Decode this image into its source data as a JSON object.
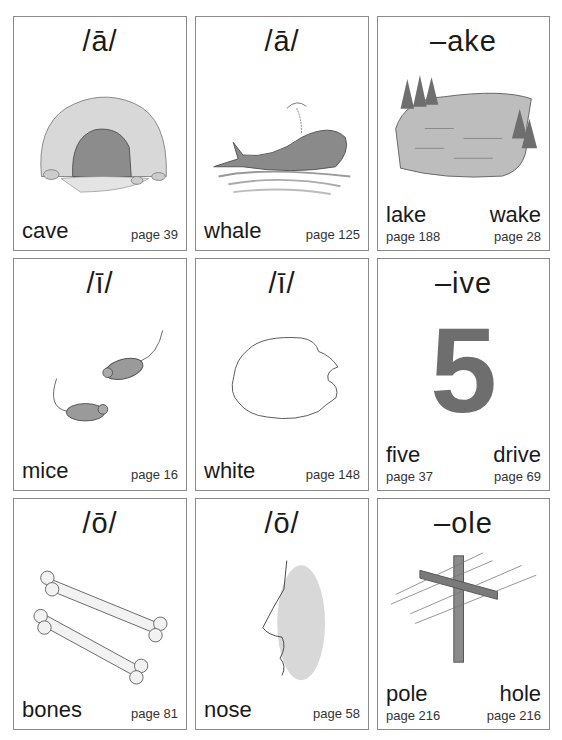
{
  "cards": [
    {
      "title": "/ā/",
      "word": "cave",
      "page": "page 39",
      "picture": "cave-illustration"
    },
    {
      "title": "/ā/",
      "word": "whale",
      "page": "page 125",
      "picture": "whale-illustration"
    },
    {
      "title": "–ake",
      "words": [
        {
          "word": "lake",
          "page": "page 188"
        },
        {
          "word": "wake",
          "page": "page 28"
        }
      ],
      "picture": "lake-illustration"
    },
    {
      "title": "/ī/",
      "word": "mice",
      "page": "page 16",
      "picture": "mice-illustration"
    },
    {
      "title": "/ī/",
      "word": "white",
      "page": "page 148",
      "picture": "white-blob-outline"
    },
    {
      "title": "–ive",
      "words": [
        {
          "word": "five",
          "page": "page 37"
        },
        {
          "word": "drive",
          "page": "page 69"
        }
      ],
      "picture": "number-five",
      "numeral": "5"
    },
    {
      "title": "/ō/",
      "word": "bones",
      "page": "page 81",
      "picture": "bones-illustration"
    },
    {
      "title": "/ō/",
      "word": "nose",
      "page": "page 58",
      "picture": "nose-illustration"
    },
    {
      "title": "–ole",
      "words": [
        {
          "word": "pole",
          "page": "page 216"
        },
        {
          "word": "hole",
          "page": "page 216"
        }
      ],
      "picture": "telephone-pole-illustration"
    }
  ],
  "colors": {
    "border": "#8a8a8a",
    "text": "#1a1a1a",
    "illustration": "#7a7a7a"
  }
}
